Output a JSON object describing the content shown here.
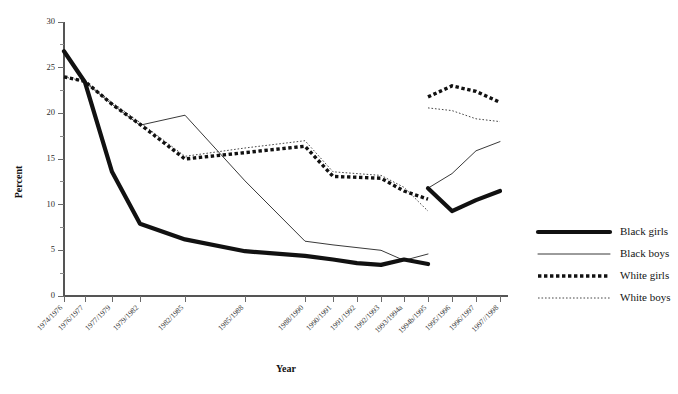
{
  "chart_data": {
    "type": "line",
    "title": "",
    "xlabel": "Year",
    "ylabel": "Percent",
    "ylim": [
      0,
      30
    ],
    "yticks": [
      0,
      5,
      10,
      15,
      20,
      25,
      30
    ],
    "yticklabels": [
      "0",
      "5",
      "10",
      "15",
      "20",
      "25",
      "30"
    ],
    "yminorticks": [
      2.5,
      7.5,
      12.5,
      17.5,
      22.5,
      27.5
    ],
    "grid": false,
    "legend_position": "right",
    "categories": [
      "1974/1976",
      "1976/1977",
      "1977/1979",
      "1979/1982",
      "1982/1985",
      "1985/1988",
      "1988/1990",
      "1990/1991",
      "1991/1992",
      "1992/1993",
      "1993/1994a",
      "1994b/1995",
      "1995/1996",
      "1996/1997",
      "1997//1998"
    ],
    "x_positions": [
      64,
      85,
      112,
      140,
      185,
      245,
      305,
      333,
      357,
      381,
      404,
      428,
      452,
      476,
      500
    ],
    "note": "Series break between 1993/1994a and 1994b/1995 (survey methodology change); lines are drawn as two disconnected spans.",
    "series": [
      {
        "name": "Black girls",
        "style": "thick-solid",
        "color": "#111111",
        "values": [
          26.8,
          23.4,
          13.6,
          7.9,
          6.2,
          4.9,
          4.4,
          4.0,
          3.6,
          3.4,
          4.0,
          3.5,
          null,
          null,
          null
        ],
        "values_segment2": [
          null,
          null,
          null,
          null,
          null,
          null,
          null,
          null,
          null,
          null,
          null,
          11.8,
          9.3,
          10.5,
          11.5
        ]
      },
      {
        "name": "Black boys",
        "style": "thin-solid",
        "color": "#222222",
        "values": [
          26.8,
          23.4,
          21.0,
          18.7,
          19.8,
          12.6,
          6.0,
          5.6,
          5.3,
          5.0,
          3.9,
          4.6,
          null,
          null,
          null
        ],
        "values_segment2": [
          null,
          null,
          null,
          null,
          null,
          null,
          null,
          null,
          null,
          null,
          null,
          11.8,
          13.4,
          15.9,
          16.9
        ]
      },
      {
        "name": "White girls",
        "style": "thick-dotted",
        "color": "#111111",
        "values": [
          24.0,
          23.5,
          21.0,
          18.8,
          15.0,
          15.7,
          16.4,
          13.1,
          13.0,
          12.9,
          11.5,
          10.6,
          null,
          null,
          null
        ],
        "values_segment2": [
          null,
          null,
          null,
          null,
          null,
          null,
          null,
          null,
          null,
          null,
          null,
          21.8,
          23.0,
          22.4,
          21.2
        ]
      },
      {
        "name": "White boys",
        "style": "thin-dotted",
        "color": "#333333",
        "values": [
          24.0,
          23.5,
          21.2,
          19.0,
          15.3,
          16.2,
          17.0,
          13.6,
          13.4,
          13.2,
          11.9,
          9.3,
          null,
          null,
          null
        ],
        "values_segment2": [
          null,
          null,
          null,
          null,
          null,
          null,
          null,
          null,
          null,
          null,
          null,
          20.6,
          20.3,
          19.4,
          19.1
        ]
      }
    ]
  },
  "legend": {
    "items": [
      {
        "label": "Black girls",
        "style": "thick-solid"
      },
      {
        "label": "Black boys",
        "style": "thin-solid"
      },
      {
        "label": "White girls",
        "style": "thick-dotted"
      },
      {
        "label": "White boys",
        "style": "thin-dotted"
      }
    ]
  }
}
